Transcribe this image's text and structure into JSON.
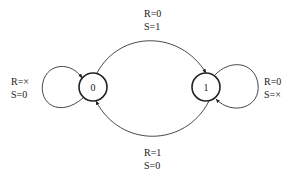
{
  "diagram": {
    "type": "state-machine",
    "states": [
      {
        "id": "s0",
        "label": "0"
      },
      {
        "id": "s1",
        "label": "1"
      }
    ],
    "transitions": [
      {
        "from": "0",
        "to": "1",
        "label_line1": "R=0",
        "label_line2": "S=1"
      },
      {
        "from": "1",
        "to": "0",
        "label_line1": "R=1",
        "label_line2": "S=0"
      },
      {
        "from": "0",
        "to": "0",
        "label_line1": "R=×",
        "label_line2": "S=0"
      },
      {
        "from": "1",
        "to": "1",
        "label_line1": "R=0",
        "label_line2": "S=×"
      }
    ],
    "colors": {
      "stroke": "#222222",
      "background": "#ffffff"
    }
  }
}
